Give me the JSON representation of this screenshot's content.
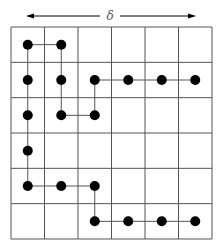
{
  "label": "δ",
  "grid": {
    "cols": 6,
    "rows": 6,
    "x0": 11,
    "y0": 27,
    "x1": 212,
    "y1": 239,
    "line_color": "#555555"
  },
  "dot_color": "#000000",
  "dots": [
    [
      0,
      0
    ],
    [
      1,
      0
    ],
    [
      0,
      1
    ],
    [
      1,
      1
    ],
    [
      2,
      1
    ],
    [
      3,
      1
    ],
    [
      4,
      1
    ],
    [
      5,
      1
    ],
    [
      0,
      2
    ],
    [
      1,
      2
    ],
    [
      2,
      2
    ],
    [
      0,
      3
    ],
    [
      0,
      4
    ],
    [
      1,
      4
    ],
    [
      2,
      4
    ],
    [
      2,
      5
    ],
    [
      3,
      5
    ],
    [
      4,
      5
    ],
    [
      5,
      5
    ]
  ],
  "paths": [
    [
      [
        1,
        0
      ],
      [
        0,
        0
      ],
      [
        0,
        1
      ],
      [
        0,
        2
      ],
      [
        0,
        3
      ],
      [
        0,
        4
      ],
      [
        1,
        4
      ],
      [
        2,
        4
      ],
      [
        2,
        5
      ],
      [
        3,
        5
      ],
      [
        4,
        5
      ],
      [
        5,
        5
      ]
    ],
    [
      [
        1,
        0
      ],
      [
        1,
        1
      ],
      [
        1,
        2
      ],
      [
        2,
        2
      ],
      [
        2,
        1
      ],
      [
        3,
        1
      ],
      [
        4,
        1
      ],
      [
        5,
        1
      ]
    ]
  ]
}
